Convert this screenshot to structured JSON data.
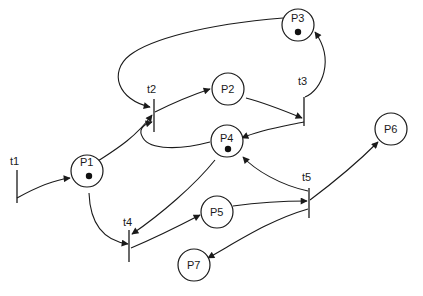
{
  "diagram": {
    "type": "petri-net",
    "colors": {
      "stroke": "#1a1a1a",
      "background": "#ffffff",
      "token": "#111111"
    },
    "places": [
      {
        "id": "P1",
        "label": "P1",
        "tokens": 1
      },
      {
        "id": "P2",
        "label": "P2",
        "tokens": 0
      },
      {
        "id": "P3",
        "label": "P3",
        "tokens": 1
      },
      {
        "id": "P4",
        "label": "P4",
        "tokens": 1
      },
      {
        "id": "P5",
        "label": "P5",
        "tokens": 0
      },
      {
        "id": "P6",
        "label": "P6",
        "tokens": 0
      },
      {
        "id": "P7",
        "label": "P7",
        "tokens": 0
      }
    ],
    "transitions": [
      {
        "id": "t1",
        "label": "t1"
      },
      {
        "id": "t2",
        "label": "t2"
      },
      {
        "id": "t3",
        "label": "t3"
      },
      {
        "id": "t4",
        "label": "t4"
      },
      {
        "id": "t5",
        "label": "t5"
      }
    ],
    "arcs": [
      {
        "from": "t1",
        "to": "P1"
      },
      {
        "from": "P1",
        "to": "t2"
      },
      {
        "from": "P1",
        "to": "t4"
      },
      {
        "from": "P3",
        "to": "t2"
      },
      {
        "from": "P4",
        "to": "t2"
      },
      {
        "from": "t2",
        "to": "P2"
      },
      {
        "from": "P2",
        "to": "t3"
      },
      {
        "from": "t3",
        "to": "P3"
      },
      {
        "from": "t3",
        "to": "P4"
      },
      {
        "from": "P4",
        "to": "t4"
      },
      {
        "from": "t4",
        "to": "P5"
      },
      {
        "from": "P5",
        "to": "t5"
      },
      {
        "from": "t5",
        "to": "P4"
      },
      {
        "from": "t5",
        "to": "P6"
      },
      {
        "from": "t5",
        "to": "P7"
      }
    ]
  }
}
